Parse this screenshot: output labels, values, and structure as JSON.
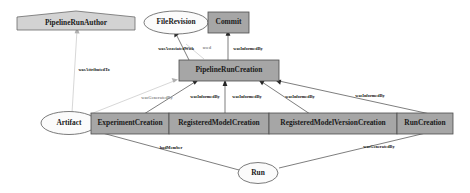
{
  "diagram": {
    "colors": {
      "activity_fill": "#a6a6a6",
      "entity_fill": "#fbfbfb",
      "agent_fill": "#d3d3d3",
      "stroke": "#4d4d4d",
      "edge": "#262626",
      "edge_faint": "#b6b6b6"
    },
    "nodes": [
      {
        "id": "pipeline-run-author",
        "label": "PipelineRunAuthor",
        "shape": "pentagon",
        "role": "agent"
      },
      {
        "id": "file-revision",
        "label": "FileRevision",
        "shape": "ellipse",
        "role": "entity"
      },
      {
        "id": "commit",
        "label": "Commit",
        "shape": "rect",
        "role": "activity"
      },
      {
        "id": "pipeline-run-creation",
        "label": "PipelineRunCreation",
        "shape": "rect",
        "role": "activity"
      },
      {
        "id": "artifact",
        "label": "Artifact",
        "shape": "ellipse",
        "role": "entity"
      },
      {
        "id": "experiment-creation",
        "label": "ExperimentCreation",
        "shape": "rect",
        "role": "activity"
      },
      {
        "id": "registered-model-creation",
        "label": "RegisteredModelCreation",
        "shape": "rect",
        "role": "activity"
      },
      {
        "id": "registered-model-version-creation",
        "label": "RegisteredModelVersionCreation",
        "shape": "rect",
        "role": "activity"
      },
      {
        "id": "run-creation",
        "label": "RunCreation",
        "shape": "rect",
        "role": "activity"
      },
      {
        "id": "run",
        "label": "Run",
        "shape": "ellipse",
        "role": "entity"
      }
    ],
    "edges": [
      {
        "id": "e-was-associated-with",
        "label": "wasAssociatedWith",
        "from": "pipeline-run-creation",
        "to": "file-revision",
        "style": "solid"
      },
      {
        "id": "e-used",
        "label": "used",
        "from": "pipeline-run-creation",
        "to": "file-revision",
        "style": "faint"
      },
      {
        "id": "e-was-informed-by-commit",
        "label": "wasInformedBy",
        "from": "pipeline-run-creation",
        "to": "commit",
        "style": "solid"
      },
      {
        "id": "e-was-attributed-to",
        "label": "wasAttributedTo",
        "from": "artifact",
        "to": "pipeline-run-author",
        "style": "faint"
      },
      {
        "id": "e-was-generated-by-artifact",
        "label": "wasGeneratedBy",
        "from": "artifact",
        "to": "pipeline-run-creation",
        "style": "faint"
      },
      {
        "id": "e-was-informed-by-experiment",
        "label": "wasInformedBy",
        "from": "experiment-creation",
        "to": "pipeline-run-creation",
        "style": "solid"
      },
      {
        "id": "e-was-informed-by-registered-model",
        "label": "wasInformedBy",
        "from": "registered-model-creation",
        "to": "pipeline-run-creation",
        "style": "solid"
      },
      {
        "id": "e-was-informed-by-registered-model-version",
        "label": "wasInformedBy",
        "from": "registered-model-version-creation",
        "to": "pipeline-run-creation",
        "style": "solid"
      },
      {
        "id": "e-was-informed-by-run-creation",
        "label": "wasInformedBy",
        "from": "run-creation",
        "to": "pipeline-run-creation",
        "style": "solid"
      },
      {
        "id": "e-had-member",
        "label": "hadMember",
        "from": "run",
        "to": "artifact",
        "style": "solid"
      },
      {
        "id": "e-was-generated-by-run",
        "label": "wasGeneratedBy",
        "from": "run",
        "to": "run-creation",
        "style": "solid"
      }
    ]
  }
}
